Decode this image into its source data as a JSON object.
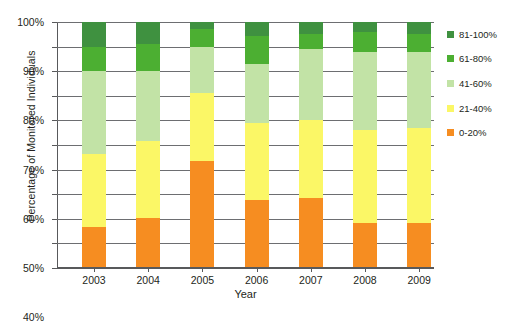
{
  "chart_data": {
    "type": "bar",
    "stacked": true,
    "title": "",
    "xlabel": "Year",
    "ylabel": "Percentage of Monitored Individuals",
    "categories": [
      "2003",
      "2004",
      "2005",
      "2006",
      "2007",
      "2008",
      "2009"
    ],
    "ylim": [
      0,
      100
    ],
    "ytick_labels": [
      "0%",
      "10%",
      "20%",
      "30%",
      "40%",
      "50%",
      "60%",
      "70%",
      "80%",
      "90%",
      "100%"
    ],
    "ytick_values": [
      0,
      10,
      20,
      30,
      40,
      50,
      60,
      70,
      80,
      90,
      100
    ],
    "grid": true,
    "legend_position": "right",
    "series": [
      {
        "name": "0-20%",
        "color": "#f68d21",
        "values": [
          16.5,
          20.5,
          43.5,
          27.5,
          28.5,
          18.5,
          18.5
        ]
      },
      {
        "name": "21-40%",
        "color": "#fbf766",
        "values": [
          30.0,
          31.0,
          27.5,
          31.5,
          31.5,
          37.5,
          38.5
        ]
      },
      {
        "name": "41-60%",
        "color": "#c2e3a6",
        "values": [
          33.5,
          28.5,
          19.0,
          24.0,
          29.0,
          32.0,
          31.0
        ]
      },
      {
        "name": "61-80%",
        "color": "#4caf32",
        "values": [
          10.0,
          11.0,
          7.0,
          11.5,
          6.0,
          8.0,
          7.0
        ]
      },
      {
        "name": "81-100%",
        "color": "#3f9140",
        "values": [
          10.0,
          9.0,
          3.0,
          5.5,
          5.0,
          4.0,
          5.0
        ]
      }
    ]
  },
  "legend": {
    "items": [
      {
        "label": "81-100%",
        "color": "#3f9140"
      },
      {
        "label": "61-80%",
        "color": "#4caf32"
      },
      {
        "label": "41-60%",
        "color": "#c2e3a6"
      },
      {
        "label": "21-40%",
        "color": "#fbf766"
      },
      {
        "label": "0-20%",
        "color": "#f68d21"
      }
    ]
  },
  "axes": {
    "y_title": "Percentage of Monitored Individuals",
    "x_title": "Year"
  }
}
